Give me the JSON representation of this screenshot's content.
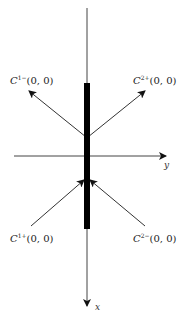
{
  "diagram": {
    "axes": {
      "x_label": "x",
      "y_label": "y"
    },
    "labels": {
      "top_left": {
        "symbol": "C",
        "superscript": "1−",
        "args": "(0, 0)"
      },
      "top_right": {
        "symbol": "C",
        "superscript": "2+",
        "args": "(0, 0)"
      },
      "bottom_left": {
        "symbol": "C",
        "superscript": "1+",
        "args": "(0, 0)"
      },
      "bottom_right": {
        "symbol": "C",
        "superscript": "2−",
        "args": "(0, 0)"
      }
    },
    "colors": {
      "line": "#333333",
      "thick_bar": "#000000",
      "background": "#ffffff"
    }
  }
}
